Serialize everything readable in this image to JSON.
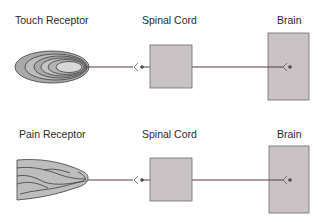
{
  "diagram": {
    "rows": [
      {
        "receptor_label": "Touch Receptor",
        "spinal_label": "Spinal Cord",
        "brain_label": "Brain",
        "receptor_type": "touch-receptor-concentric-ellipses"
      },
      {
        "receptor_label": "Pain Receptor",
        "spinal_label": "Spinal Cord",
        "brain_label": "Brain",
        "receptor_type": "pain-receptor-branched-free-nerve-ending"
      }
    ],
    "colors": {
      "box_fill": "#c9c3c6",
      "box_stroke": "#6e6a6c",
      "nerve_line": "#5a3a42",
      "receptor_fill": "#d2d2d2",
      "receptor_stroke": "#3c3c3c"
    }
  }
}
